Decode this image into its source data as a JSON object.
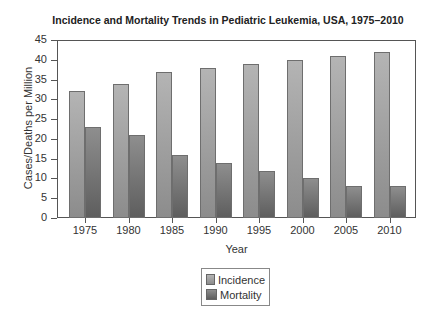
{
  "chart_data": {
    "type": "bar",
    "title": "Incidence and Mortality Trends in Pediatric Leukemia, USA, 1975–2010",
    "xlabel": "Year",
    "ylabel": "Cases/Deaths per Million",
    "categories": [
      "1975",
      "1980",
      "1985",
      "1990",
      "1995",
      "2000",
      "2005",
      "2010"
    ],
    "series": [
      {
        "name": "Incidence",
        "values": [
          32,
          34,
          37,
          38,
          39,
          40,
          41,
          42
        ],
        "color": "#a0a0a0"
      },
      {
        "name": "Mortality",
        "values": [
          23,
          21,
          16,
          14,
          12,
          10,
          8,
          8
        ],
        "color": "#767676"
      }
    ],
    "ylim": [
      0,
      45
    ],
    "yticks": [
      "0",
      "5",
      "10",
      "15",
      "20",
      "25",
      "30",
      "35",
      "40",
      "45"
    ],
    "grid": false,
    "legend_position": "bottom-center"
  }
}
